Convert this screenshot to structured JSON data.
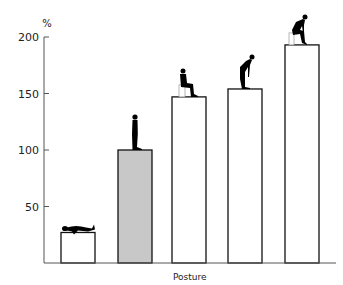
{
  "chart_data": {
    "type": "bar",
    "title": "",
    "xlabel": "Posture",
    "ylabel": "%",
    "ylim": [
      0,
      200
    ],
    "yticks": [
      50,
      100,
      150,
      200
    ],
    "grid": false,
    "legend": null,
    "categories": [
      "Lying",
      "Standing",
      "Sitting",
      "Standing bent forward",
      "Sitting bent forward"
    ],
    "values": [
      27,
      100,
      147,
      154,
      193
    ],
    "bar_fills": [
      "#ffffff",
      "#c8c8c8",
      "#ffffff",
      "#ffffff",
      "#ffffff"
    ],
    "bar_icons": [
      "lying-figure-icon",
      "standing-figure-icon",
      "sitting-figure-icon",
      "bending-figure-icon",
      "sitting-bent-figure-icon"
    ]
  },
  "axis": {
    "unit_label": "%",
    "x_title": "Posture",
    "tick_labels": [
      "50",
      "100",
      "150",
      "200"
    ]
  },
  "colors": {
    "axis": "#555555",
    "bar_stroke": "#111111",
    "highlight_fill": "#c8c8c8",
    "figure": "#000000"
  }
}
